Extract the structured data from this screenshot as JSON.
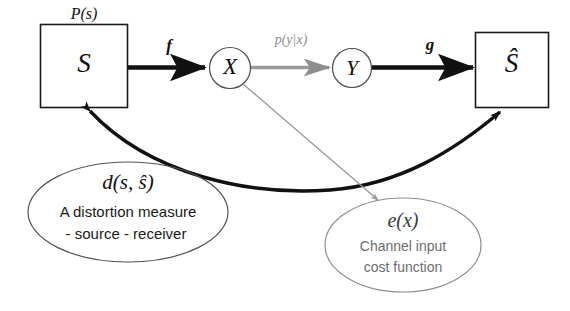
{
  "diagram": {
    "background_color": "#ffffff",
    "nodes": {
      "source_box": {
        "label": "S",
        "top_label": "P(s)",
        "shape": "rectangle"
      },
      "channel_input": {
        "label": "X",
        "shape": "circle"
      },
      "channel_output": {
        "label": "Y",
        "shape": "circle"
      },
      "estimate_box": {
        "label": "Ŝ",
        "shape": "rectangle"
      }
    },
    "edges": {
      "encoder": {
        "label": "f",
        "from": "source_box",
        "to": "channel_input",
        "style": "thick-black-arrow",
        "color": "#111111"
      },
      "channel": {
        "label": "p(y|x)",
        "from": "channel_input",
        "to": "channel_output",
        "style": "thin-grey-arrow",
        "color": "#8e8e8e"
      },
      "decoder": {
        "label": "g",
        "from": "channel_output",
        "to": "estimate_box",
        "style": "thick-black-arrow",
        "color": "#111111"
      },
      "distortion_link": {
        "label": "",
        "from": "source_box",
        "to": "estimate_box",
        "style": "thick-curved-double-arrow",
        "color": "#111111"
      },
      "cost_link": {
        "label": "",
        "from": "channel_input",
        "to": "cost_ellipse",
        "style": "thin-grey-line",
        "color": "#9a9a9a"
      }
    },
    "annotations": {
      "distortion_ellipse": {
        "title": "d(s, ŝ)",
        "line1": "A distortion measure",
        "line2": "-  source - receiver",
        "color": "#111111"
      },
      "cost_ellipse": {
        "title": "e(x)",
        "line1": "Channel input",
        "line2": "cost function",
        "color": "#6e6e6e"
      }
    }
  }
}
